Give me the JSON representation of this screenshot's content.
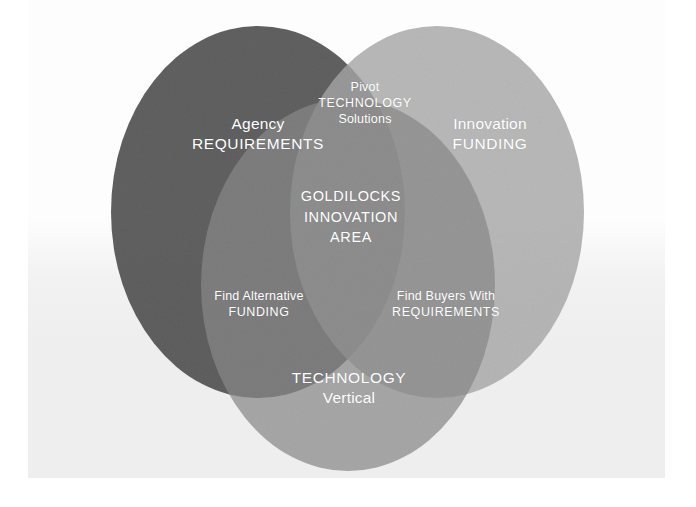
{
  "diagram": {
    "title": "Goldilocks Innovation Area",
    "type": "venn-3-circle",
    "background_color": "#eeeeee",
    "page_color": "#ffffff",
    "text_color": "#ffffff",
    "circles": [
      {
        "id": "requirements",
        "position": "left",
        "label_line1": "Agency",
        "label_line2": "REQUIREMENTS",
        "color": "#4a4a4a",
        "cx": 258,
        "cy": 212,
        "rx": 147,
        "ry": 186
      },
      {
        "id": "funding",
        "position": "right",
        "label_line1": "Innovation",
        "label_line2": "FUNDING",
        "color": "#b3b3b3",
        "cx": 437,
        "cy": 212,
        "rx": 147,
        "ry": 186
      },
      {
        "id": "technology",
        "position": "bottom",
        "label_line1": "TECHNOLOGY",
        "label_line2": "Vertical",
        "color": "#8c8c8c",
        "cx": 348,
        "cy": 285,
        "rx": 147,
        "ry": 186
      }
    ],
    "overlaps": [
      {
        "id": "requirements-funding",
        "position": "top",
        "sets": "Agency REQUIREMENTS + Innovation FUNDING",
        "label_line1": "Pivot",
        "label_line2": "TECHNOLOGY",
        "label_line3": "Solutions"
      },
      {
        "id": "requirements-technology",
        "position": "bottom-left",
        "sets": "Agency REQUIREMENTS + TECHNOLOGY Vertical",
        "label_line1": "Find Alternative",
        "label_line2": "FUNDING"
      },
      {
        "id": "funding-technology",
        "position": "bottom-right",
        "sets": "Innovation FUNDING + TECHNOLOGY Vertical",
        "label_line1": "Find Buyers With",
        "label_line2": "REQUIREMENTS"
      }
    ],
    "center": {
      "id": "goldilocks",
      "sets": "all three",
      "label_line1": "GOLDILOCKS",
      "label_line2": "INNOVATION",
      "label_line3": "AREA"
    }
  }
}
